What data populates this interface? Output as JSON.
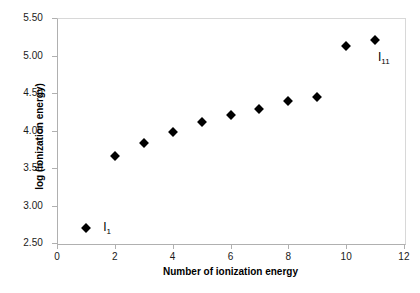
{
  "chart_data": {
    "type": "scatter",
    "title": "",
    "xlabel": "Number of ionization energy",
    "ylabel": "log (ionization energy)",
    "xlim": [
      0,
      12
    ],
    "ylim": [
      2.5,
      5.5
    ],
    "xticks": [
      "0",
      "2",
      "4",
      "6",
      "8",
      "10",
      "12"
    ],
    "xtick_values": [
      0,
      2,
      4,
      6,
      8,
      10,
      12
    ],
    "yticks": [
      "2.50",
      "3.00",
      "3.50",
      "4.00",
      "4.50",
      "5.00",
      "5.50"
    ],
    "ytick_values": [
      2.5,
      3.0,
      3.5,
      4.0,
      4.5,
      5.0,
      5.5
    ],
    "grid": false,
    "legend": "none",
    "marker": "diamond",
    "marker_color": "#000000",
    "x": [
      1,
      2,
      3,
      4,
      5,
      6,
      7,
      8,
      9,
      10,
      11
    ],
    "y": [
      2.7,
      3.66,
      3.84,
      3.98,
      4.12,
      4.21,
      4.29,
      4.4,
      4.45,
      5.13,
      5.21
    ],
    "annotations": [
      {
        "label": "I",
        "sub": "1",
        "x": 1.6,
        "y": 2.7
      },
      {
        "label": "I",
        "sub": "11",
        "x": 11.1,
        "y": 4.97
      }
    ]
  },
  "axis_color": "#b0b0b0",
  "text_color": "#000000"
}
